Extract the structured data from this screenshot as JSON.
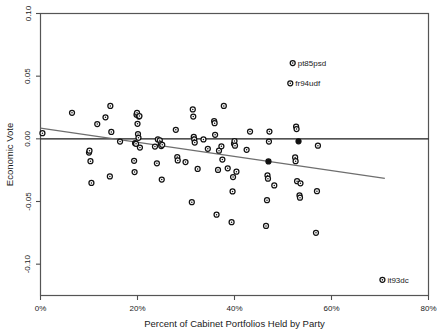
{
  "chart_data": {
    "type": "scatter",
    "title": "",
    "xlabel": "Percent of Cabinet Portfolios Held by Party",
    "ylabel": "Economic Vote",
    "xlim": [
      0,
      80
    ],
    "ylim": [
      -0.125,
      0.1
    ],
    "xticks": [
      0,
      20,
      40,
      60,
      80
    ],
    "xticklabels": [
      "0%",
      "20%",
      "40%",
      "60%",
      "80%"
    ],
    "yticks": [
      0.1,
      0.05,
      0.0,
      -0.05,
      -0.1
    ],
    "yticklabels": [
      "0.10",
      "0.05",
      "0.00",
      "-0.05",
      "-0.10"
    ],
    "grid": false,
    "legend": null,
    "reference_lines": [
      {
        "name": "zero-line",
        "orientation": "horizontal",
        "y": 0.0
      }
    ],
    "fit_line": {
      "name": "regression-line",
      "x0": 0.0,
      "y0": 0.0085,
      "x1": 71.0,
      "y1": -0.0315
    },
    "annotations": [
      {
        "label": "pt85psd",
        "x": 52.0,
        "y": 0.0605,
        "marker": "open"
      },
      {
        "label": "fr94udf",
        "x": 51.5,
        "y": 0.0443,
        "marker": "open"
      },
      {
        "label": "it93dc",
        "x": 70.5,
        "y": -0.1125,
        "marker": "open"
      }
    ],
    "points": [
      {
        "x": 0.4,
        "y": 0.0045,
        "marker": "open"
      },
      {
        "x": 6.5,
        "y": 0.0208,
        "marker": "open"
      },
      {
        "x": 10.0,
        "y": -0.011,
        "marker": "open"
      },
      {
        "x": 10.1,
        "y": -0.0095,
        "marker": "open"
      },
      {
        "x": 10.3,
        "y": -0.0178,
        "marker": "open"
      },
      {
        "x": 10.5,
        "y": -0.0352,
        "marker": "open"
      },
      {
        "x": 11.7,
        "y": 0.0118,
        "marker": "open"
      },
      {
        "x": 13.4,
        "y": 0.0172,
        "marker": "open"
      },
      {
        "x": 14.3,
        "y": -0.03,
        "marker": "open"
      },
      {
        "x": 14.4,
        "y": 0.0262,
        "marker": "open"
      },
      {
        "x": 14.6,
        "y": 0.0055,
        "marker": "open"
      },
      {
        "x": 16.4,
        "y": -0.0022,
        "marker": "open"
      },
      {
        "x": 19.3,
        "y": -0.0175,
        "marker": "open"
      },
      {
        "x": 19.4,
        "y": -0.0265,
        "marker": "open"
      },
      {
        "x": 19.5,
        "y": -0.0035,
        "marker": "filled"
      },
      {
        "x": 19.7,
        "y": -0.004,
        "marker": "open"
      },
      {
        "x": 19.8,
        "y": 0.0193,
        "marker": "open"
      },
      {
        "x": 19.9,
        "y": 0.0208,
        "marker": "open"
      },
      {
        "x": 20.0,
        "y": 0.012,
        "marker": "open"
      },
      {
        "x": 20.1,
        "y": 0.0038,
        "marker": "open"
      },
      {
        "x": 20.2,
        "y": 0.0008,
        "marker": "open"
      },
      {
        "x": 20.3,
        "y": 0.0178,
        "marker": "open"
      },
      {
        "x": 20.4,
        "y": 0.0182,
        "marker": "open"
      },
      {
        "x": 20.5,
        "y": -0.007,
        "marker": "open"
      },
      {
        "x": 23.6,
        "y": -0.0062,
        "marker": "open"
      },
      {
        "x": 24.0,
        "y": -0.0195,
        "marker": "open"
      },
      {
        "x": 24.2,
        "y": -0.0005,
        "marker": "open"
      },
      {
        "x": 24.6,
        "y": -0.0012,
        "marker": "open"
      },
      {
        "x": 24.8,
        "y": -0.0042,
        "marker": "open"
      },
      {
        "x": 24.9,
        "y": -0.0058,
        "marker": "open"
      },
      {
        "x": 25.0,
        "y": -0.0325,
        "marker": "open"
      },
      {
        "x": 25.1,
        "y": -0.0048,
        "marker": "open"
      },
      {
        "x": 27.9,
        "y": 0.0072,
        "marker": "open"
      },
      {
        "x": 28.2,
        "y": -0.0145,
        "marker": "open"
      },
      {
        "x": 28.3,
        "y": -0.0172,
        "marker": "open"
      },
      {
        "x": 29.9,
        "y": -0.0185,
        "marker": "open"
      },
      {
        "x": 31.2,
        "y": -0.0505,
        "marker": "open"
      },
      {
        "x": 31.4,
        "y": 0.0235,
        "marker": "open"
      },
      {
        "x": 31.5,
        "y": 0.0178,
        "marker": "open"
      },
      {
        "x": 31.6,
        "y": 0.0015,
        "marker": "open"
      },
      {
        "x": 31.7,
        "y": -0.0005,
        "marker": "open"
      },
      {
        "x": 31.8,
        "y": -0.003,
        "marker": "open"
      },
      {
        "x": 32.4,
        "y": -0.024,
        "marker": "open"
      },
      {
        "x": 33.6,
        "y": -0.0005,
        "marker": "open"
      },
      {
        "x": 34.5,
        "y": -0.008,
        "marker": "open"
      },
      {
        "x": 35.8,
        "y": 0.0142,
        "marker": "open"
      },
      {
        "x": 35.9,
        "y": 0.0125,
        "marker": "open"
      },
      {
        "x": 36.0,
        "y": 0.0032,
        "marker": "open"
      },
      {
        "x": 36.3,
        "y": -0.0605,
        "marker": "open"
      },
      {
        "x": 36.6,
        "y": -0.0248,
        "marker": "open"
      },
      {
        "x": 36.8,
        "y": -0.0095,
        "marker": "open"
      },
      {
        "x": 37.3,
        "y": -0.006,
        "marker": "open"
      },
      {
        "x": 37.5,
        "y": -0.0165,
        "marker": "open"
      },
      {
        "x": 37.8,
        "y": 0.0262,
        "marker": "open"
      },
      {
        "x": 38.6,
        "y": -0.0235,
        "marker": "open"
      },
      {
        "x": 39.4,
        "y": -0.0665,
        "marker": "open"
      },
      {
        "x": 39.6,
        "y": -0.042,
        "marker": "open"
      },
      {
        "x": 39.7,
        "y": -0.0305,
        "marker": "open"
      },
      {
        "x": 39.9,
        "y": -0.004,
        "marker": "open"
      },
      {
        "x": 40.0,
        "y": -0.0018,
        "marker": "open"
      },
      {
        "x": 40.1,
        "y": -0.0055,
        "marker": "open"
      },
      {
        "x": 40.4,
        "y": -0.0262,
        "marker": "open"
      },
      {
        "x": 42.5,
        "y": -0.0088,
        "marker": "open"
      },
      {
        "x": 43.2,
        "y": 0.0058,
        "marker": "open"
      },
      {
        "x": 46.5,
        "y": -0.0695,
        "marker": "open"
      },
      {
        "x": 46.7,
        "y": -0.049,
        "marker": "open"
      },
      {
        "x": 46.8,
        "y": -0.0292,
        "marker": "open"
      },
      {
        "x": 46.9,
        "y": -0.0318,
        "marker": "open"
      },
      {
        "x": 47.0,
        "y": -0.018,
        "marker": "filled"
      },
      {
        "x": 47.1,
        "y": -0.0022,
        "marker": "open"
      },
      {
        "x": 47.2,
        "y": 0.0058,
        "marker": "open"
      },
      {
        "x": 48.2,
        "y": -0.0372,
        "marker": "open"
      },
      {
        "x": 52.5,
        "y": -0.0148,
        "marker": "open"
      },
      {
        "x": 52.6,
        "y": -0.0178,
        "marker": "open"
      },
      {
        "x": 52.7,
        "y": 0.0098,
        "marker": "open"
      },
      {
        "x": 52.8,
        "y": 0.0078,
        "marker": "open"
      },
      {
        "x": 52.9,
        "y": -0.0338,
        "marker": "open"
      },
      {
        "x": 53.2,
        "y": -0.002,
        "marker": "filled"
      },
      {
        "x": 53.4,
        "y": -0.0452,
        "marker": "open"
      },
      {
        "x": 53.5,
        "y": -0.047,
        "marker": "open"
      },
      {
        "x": 53.6,
        "y": -0.0355,
        "marker": "open"
      },
      {
        "x": 56.8,
        "y": -0.075,
        "marker": "open"
      },
      {
        "x": 57.0,
        "y": -0.0418,
        "marker": "open"
      },
      {
        "x": 57.2,
        "y": -0.0055,
        "marker": "open"
      }
    ]
  }
}
